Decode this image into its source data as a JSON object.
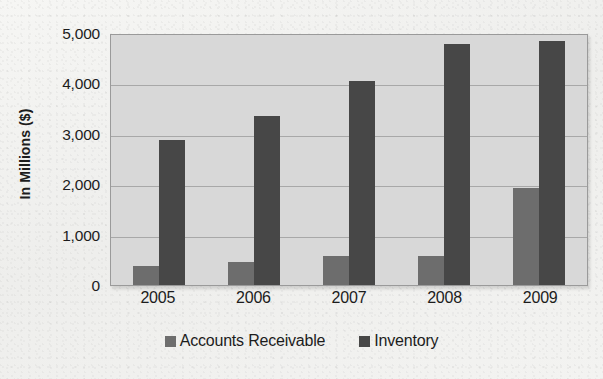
{
  "chart_data": {
    "type": "bar",
    "title": "",
    "xlabel": "",
    "ylabel": "In Millions ($)",
    "categories": [
      "2005",
      "2006",
      "2007",
      "2008",
      "2009"
    ],
    "series": [
      {
        "name": "Accounts Receivable",
        "color": "#6d6d6d",
        "values": [
          380,
          460,
          570,
          580,
          1920
        ]
      },
      {
        "name": "Inventory",
        "color": "#474747",
        "values": [
          2870,
          3350,
          4050,
          4780,
          4840
        ]
      }
    ],
    "ylim": [
      0,
      5000
    ],
    "yticks": [
      0,
      1000,
      2000,
      3000,
      4000,
      5000
    ],
    "ytick_labels": [
      "0",
      "1,000",
      "2,000",
      "3,000",
      "4,000",
      "5,000"
    ],
    "grid": true,
    "legend_position": "bottom",
    "plot_background": "#d8d8d8"
  }
}
